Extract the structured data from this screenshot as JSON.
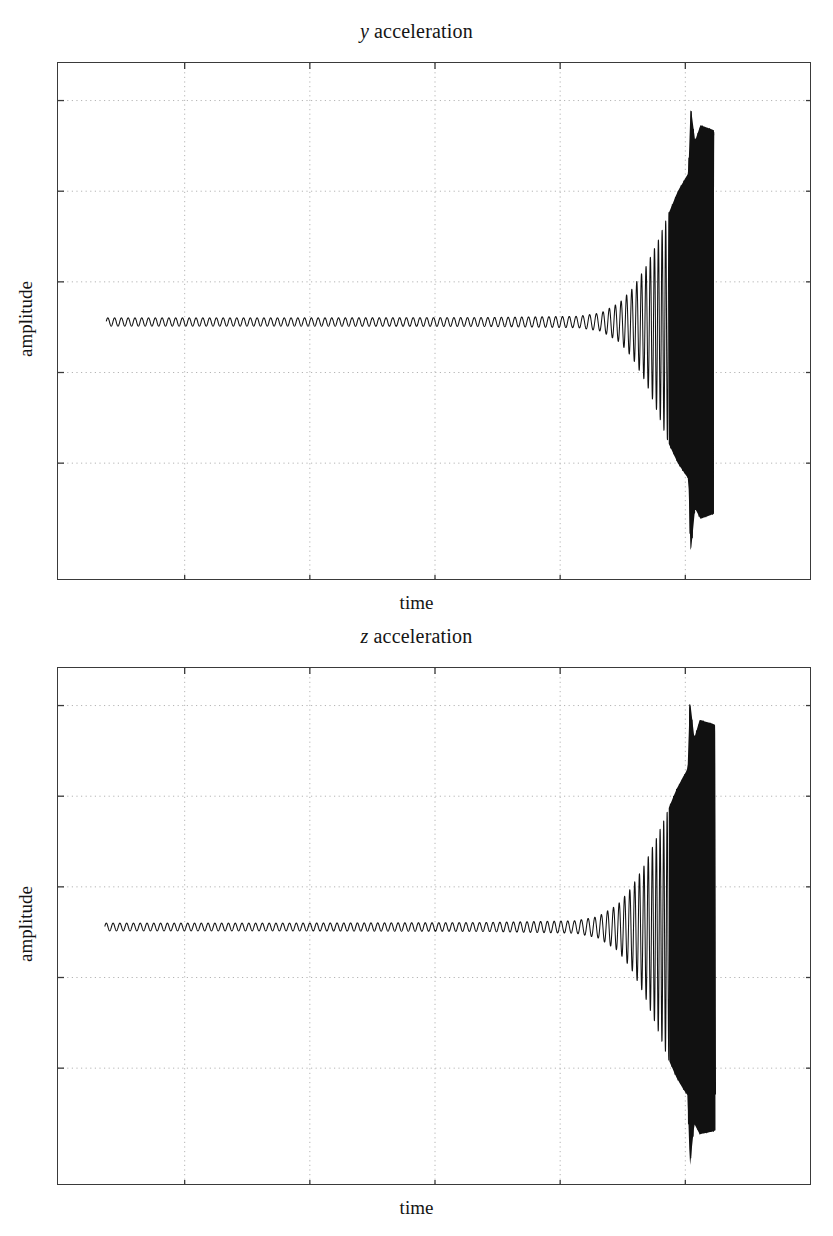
{
  "figure": {
    "background_color": "#ffffff",
    "ink_color": "#141414",
    "frame_color": "#3a3a3a",
    "grid_color": "#b4b4b4",
    "trace_color": "#111111"
  },
  "panels": [
    {
      "id": "y-acceleration",
      "title_variable": "y",
      "title_text": "acceleration",
      "xlabel": "time",
      "ylabel": "amplitude",
      "frame": {
        "x": 57,
        "y": 62,
        "width": 754,
        "height": 518
      },
      "title_y": 20,
      "xlabel_y": 592,
      "ylabel_center": {
        "x": 26,
        "y": 321
      }
    },
    {
      "id": "z-acceleration",
      "title_variable": "z",
      "title_text": "acceleration",
      "xlabel": "time",
      "ylabel": "amplitude",
      "frame": {
        "x": 57,
        "y": 667,
        "width": 754,
        "height": 518
      },
      "title_y": 625,
      "xlabel_y": 1197,
      "ylabel_center": {
        "x": 26,
        "y": 926
      }
    }
  ],
  "chart_data": {
    "type": "line",
    "xlabel": "time",
    "ylabel": "amplitude",
    "xlim": [
      0,
      1
    ],
    "ylim": [
      -1,
      1
    ],
    "grid": true,
    "grid_x_ticks": [
      0.168,
      0.334,
      0.5,
      0.666,
      0.832
    ],
    "grid_y_ticks": [
      0.855,
      0.505,
      0.155,
      -0.195,
      -0.545
    ],
    "axis_tick_labels_visible": false,
    "legend": "none",
    "series": [
      {
        "name": "y acceleration",
        "panel": "y-acceleration",
        "trace_start_x": 0.064,
        "trace_end_x": 0.87,
        "baseline_amplitude": 0.0155,
        "growth_onset_x": 0.714,
        "saturation_x": 0.84,
        "peak_positive_amplitude": 0.835,
        "peak_negative_amplitude": -0.9,
        "base_period_x": 0.009,
        "final_period_x": 0.003,
        "envelope_points": [
          {
            "x": 0.064,
            "upper": 0.016,
            "lower": -0.016
          },
          {
            "x": 0.3,
            "upper": 0.016,
            "lower": -0.016
          },
          {
            "x": 0.56,
            "upper": 0.017,
            "lower": -0.017
          },
          {
            "x": 0.69,
            "upper": 0.022,
            "lower": -0.022
          },
          {
            "x": 0.72,
            "upper": 0.035,
            "lower": -0.035
          },
          {
            "x": 0.745,
            "upper": 0.075,
            "lower": -0.078
          },
          {
            "x": 0.762,
            "upper": 0.13,
            "lower": -0.14
          },
          {
            "x": 0.78,
            "upper": 0.215,
            "lower": -0.235
          },
          {
            "x": 0.796,
            "upper": 0.315,
            "lower": -0.355
          },
          {
            "x": 0.81,
            "upper": 0.42,
            "lower": -0.47
          },
          {
            "x": 0.822,
            "upper": 0.505,
            "lower": -0.545
          },
          {
            "x": 0.83,
            "upper": 0.545,
            "lower": -0.58
          },
          {
            "x": 0.836,
            "upper": 0.575,
            "lower": -0.605
          },
          {
            "x": 0.839,
            "upper": 0.835,
            "lower": -0.9
          },
          {
            "x": 0.845,
            "upper": 0.7,
            "lower": -0.72
          },
          {
            "x": 0.852,
            "upper": 0.76,
            "lower": -0.76
          },
          {
            "x": 0.866,
            "upper": 0.745,
            "lower": -0.745
          },
          {
            "x": 0.87,
            "upper": 0.74,
            "lower": -0.74
          }
        ]
      },
      {
        "name": "z acceleration",
        "panel": "z-acceleration",
        "trace_start_x": 0.062,
        "trace_end_x": 0.872,
        "baseline_amplitude": 0.015,
        "growth_onset_x": 0.708,
        "saturation_x": 0.84,
        "peak_positive_amplitude": 0.88,
        "peak_negative_amplitude": -0.93,
        "base_period_x": 0.009,
        "final_period_x": 0.003,
        "envelope_points": [
          {
            "x": 0.062,
            "upper": 0.015,
            "lower": -0.015
          },
          {
            "x": 0.3,
            "upper": 0.015,
            "lower": -0.015
          },
          {
            "x": 0.56,
            "upper": 0.017,
            "lower": -0.017
          },
          {
            "x": 0.686,
            "upper": 0.024,
            "lower": -0.024
          },
          {
            "x": 0.716,
            "upper": 0.04,
            "lower": -0.042
          },
          {
            "x": 0.742,
            "upper": 0.085,
            "lower": -0.09
          },
          {
            "x": 0.76,
            "upper": 0.15,
            "lower": -0.16
          },
          {
            "x": 0.778,
            "upper": 0.24,
            "lower": -0.265
          },
          {
            "x": 0.794,
            "upper": 0.345,
            "lower": -0.385
          },
          {
            "x": 0.808,
            "upper": 0.445,
            "lower": -0.5
          },
          {
            "x": 0.82,
            "upper": 0.53,
            "lower": -0.58
          },
          {
            "x": 0.829,
            "upper": 0.58,
            "lower": -0.625
          },
          {
            "x": 0.835,
            "upper": 0.61,
            "lower": -0.65
          },
          {
            "x": 0.838,
            "upper": 0.88,
            "lower": -0.93
          },
          {
            "x": 0.844,
            "upper": 0.73,
            "lower": -0.76
          },
          {
            "x": 0.851,
            "upper": 0.8,
            "lower": -0.8
          },
          {
            "x": 0.868,
            "upper": 0.785,
            "lower": -0.79
          },
          {
            "x": 0.872,
            "upper": 0.78,
            "lower": -0.785
          }
        ]
      }
    ]
  }
}
